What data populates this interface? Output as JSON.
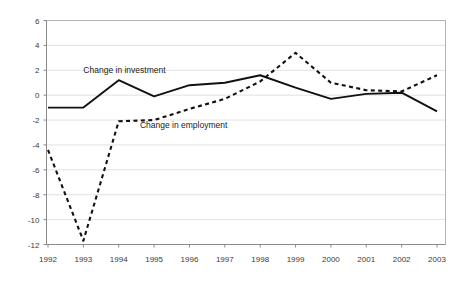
{
  "chart_data": {
    "type": "line",
    "title": "",
    "subtitle": "",
    "xlabel": "",
    "ylabel": "",
    "categories": [
      "1992",
      "1993",
      "1994",
      "1995",
      "1996",
      "1997",
      "1998",
      "1999",
      "2000",
      "2001",
      "2002",
      "2003"
    ],
    "x": [
      1992,
      1993,
      1994,
      1995,
      1996,
      1997,
      1998,
      1999,
      2000,
      2001,
      2002,
      2003
    ],
    "series": [
      {
        "name": "Change in investment",
        "style": "solid",
        "values": [
          -1.0,
          -1.0,
          1.2,
          -0.1,
          0.8,
          1.0,
          1.6,
          0.6,
          -0.3,
          0.1,
          0.2,
          -1.3
        ]
      },
      {
        "name": "Change in employment",
        "style": "dashed",
        "values": [
          -4.4,
          -11.7,
          -2.1,
          -2.0,
          -1.1,
          -0.3,
          1.1,
          3.4,
          1.0,
          0.4,
          0.3,
          1.6
        ]
      }
    ],
    "ylim": [
      -12,
      6
    ],
    "yticks": [
      6,
      4,
      2,
      0,
      -2,
      -4,
      -6,
      -8,
      -10,
      -12
    ],
    "ytick_labels": [
      "6",
      "4",
      "2",
      "0",
      "-2",
      "-4",
      "-6",
      "-8",
      "-10",
      "-12"
    ],
    "xlim": [
      1992,
      2003
    ],
    "grid": true,
    "grid_axis": "y",
    "legend": "inline-annotations",
    "annotations": [
      {
        "text": "Change in investment",
        "x": 1993.0,
        "y": 2.0
      },
      {
        "text": "Change in employment",
        "x": 1994.6,
        "y": -2.4
      }
    ],
    "colors": {
      "series_line": "#111111",
      "gridline": "#d9d9d9",
      "axis": "#8a8a8a",
      "plot_frame": "#b4b4b4",
      "tick_label": "#3a3a3a",
      "background": "#ffffff"
    }
  }
}
